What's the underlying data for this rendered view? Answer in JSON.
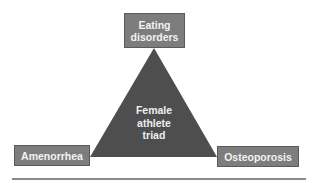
{
  "diagram": {
    "type": "triangle",
    "center": {
      "label": "Female\nathlete\ntriad"
    },
    "vertices": {
      "top": {
        "label": "Eating\ndisorders"
      },
      "bottom_left": {
        "label": "Amenorrhea"
      },
      "bottom_right": {
        "label": "Osteoporosis"
      }
    },
    "colors": {
      "triangle_fill": "#4e4e4e",
      "box_fill": "#7d7d7d",
      "box_text": "#f2f2f2",
      "rule": "#8a8a8a"
    }
  }
}
